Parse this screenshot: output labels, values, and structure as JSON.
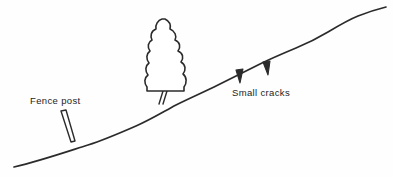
{
  "figure": {
    "background_color": "#fefefe",
    "ink_color": "#2b2b2b",
    "width": 393,
    "height": 177
  },
  "annotations": [
    {
      "id": "fence-post",
      "label": "Fence post",
      "x": 30,
      "y": 104
    },
    {
      "id": "small-cracks",
      "label": "Small cracks",
      "x": 232,
      "y": 96
    }
  ],
  "elements": {
    "ground": {
      "name": "ground-surface-line",
      "path": "M 14 167 C 40 161, 66 152, 88 145 C 104 140, 120 133, 136 126 C 150 120, 163 112, 176 105 C 190 98, 204 92, 218 85 C 232 78, 246 71, 260 64 C 272 58, 284 53, 296 48 C 308 43, 318 38, 328 32 C 338 26, 348 20, 358 16 C 368 12, 378 9, 386 7"
    },
    "tree": {
      "name": "conifer-tree",
      "crown_path": "M 165 19 C 169 21, 171 25, 170 29 C 175 31, 177 36, 175 40 C 180 42, 181 47, 178 51 C 183 53, 184 58, 181 62 C 186 65, 186 70, 183 74 C 187 77, 187 83, 184 87 L 184 91 L 147 91 L 147 87 C 144 83, 144 78, 148 75 C 145 71, 145 66, 149 63 C 146 59, 146 54, 150 51 C 147 47, 148 42, 152 40 C 150 36, 151 31, 156 29 C 155 25, 158 20, 162 19 Z",
      "trunk_left": "M 163 91 L 159 104",
      "trunk_right": "M 167 91 L 163 104"
    },
    "fence_post": {
      "name": "fence-post-shape",
      "path": "M 61 111 L 66 110 L 75 141 L 71 142 Z"
    },
    "cracks": [
      {
        "name": "crack-mark-1",
        "path": "M 236 70 L 243 69 L 240 83 Z"
      },
      {
        "name": "crack-mark-2",
        "path": "M 263 62 L 270 61 L 268 75 Z"
      }
    ]
  }
}
